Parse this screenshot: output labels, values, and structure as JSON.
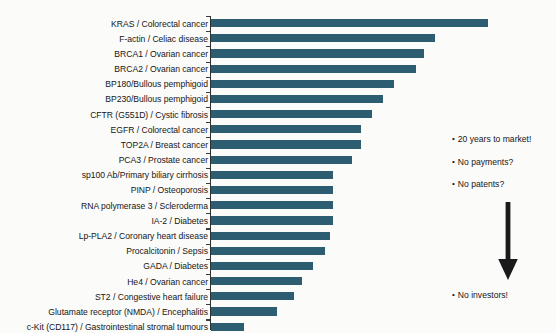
{
  "figure": {
    "background_color": "#fbfbfa",
    "bar_color": "#2d5d71",
    "axis_color": "#2f3030",
    "text_color": "#161616"
  },
  "chart_data": {
    "type": "bar",
    "orientation": "horizontal",
    "title": "",
    "subtitle": "",
    "xlabel": "",
    "ylabel": "",
    "grid": false,
    "legend": null,
    "xlim": [
      0,
      100
    ],
    "axis_tick_labels": [],
    "categories": [
      "KRAS / Colorectal cancer",
      "F-actin / Celiac disease",
      "BRCA1 / Ovarian cancer",
      "BRCA2 / Ovarian cancer",
      "BP180/Bullous pemphigoid",
      "BP230/Bullous pemphigoid",
      "CFTR (G551D) / Cystic fibrosis",
      "EGFR / Colorectal cancer",
      "TOP2A / Breast cancer",
      "PCA3 / Prostate cancer",
      "sp100 Ab/Primary biliary cirrhosis",
      "PINP / Osteoporosis",
      "RNA polymerase 3 / Scleroderma",
      "IA-2 / Diabetes",
      "Lp-PLA2 / Coronary heart disease",
      "Procalcitonin / Sepsis",
      "GADA / Diabetes",
      "He4 / Ovarian cancer",
      "ST2 / Congestive heart failure",
      "Glutamate receptor (NMDA) / Encephalitis",
      "c-Kit (CD117) / Gastrointestinal stromal tumours"
    ],
    "values": [
      100,
      81,
      77,
      74,
      66,
      62,
      58,
      54,
      54,
      51,
      44,
      44,
      44,
      44,
      43,
      41,
      37,
      33,
      30,
      24,
      12
    ]
  },
  "annotations": {
    "bullets": [
      {
        "marker": "•",
        "text": "20 years to market!"
      },
      {
        "marker": "•",
        "text": "No payments?"
      },
      {
        "marker": "•",
        "text": "No patents?"
      },
      {
        "marker": "•",
        "text": "No investors!"
      }
    ],
    "arrow": {
      "name": "down-arrow",
      "direction": "down",
      "color": "#1a1a1a"
    }
  }
}
